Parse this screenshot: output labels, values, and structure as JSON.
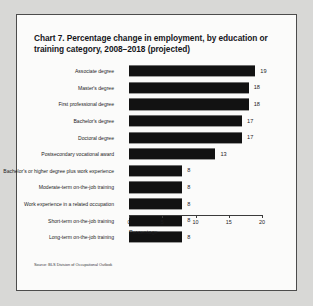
{
  "figure": {
    "title": "Chart 7. Percentage change in employment, by education or training category, 2008–2018 (projected)",
    "source": "Source: BLS Division of Occupational Outlook",
    "bar_color": "#121212",
    "background_color": "#fbfbfa",
    "page_color": "#d8d8d6",
    "border_color": "#4c4c4c"
  },
  "chart_data": {
    "type": "bar",
    "orientation": "horizontal",
    "title": "Chart 7. Percentage change in employment, by education or training category, 2008–2018 (projected)",
    "xlabel": "Percentage",
    "ylabel": "",
    "xlim": [
      0,
      20
    ],
    "xticks": [
      0,
      5,
      10,
      15,
      20
    ],
    "xtick_labels": [
      "0",
      "5",
      "10",
      "15",
      "20"
    ],
    "grid": false,
    "legend": false,
    "data_labels": true,
    "categories": [
      "Associate degree",
      "Master's degree",
      "First professional degree",
      "Bachelor's degree",
      "Doctoral degree",
      "Postsecondary vocational award",
      "Bachelor's or higher degree plus work experience",
      "Moderate-term on-the-job training",
      "Work experience in a related occupation",
      "Short-term on-the-job training",
      "Long-term on-the-job training"
    ],
    "values": [
      19,
      18,
      18,
      17,
      17,
      13,
      8,
      8,
      8,
      8,
      8
    ],
    "value_labels": [
      "19",
      "18",
      "18",
      "17",
      "17",
      "13",
      "8",
      "8",
      "8",
      "8",
      "8"
    ],
    "source": "Source: BLS Division of Occupational Outlook"
  }
}
